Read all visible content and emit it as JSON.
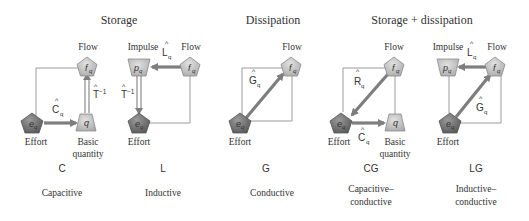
{
  "groups": {
    "storage": "Storage",
    "dissipation": "Dissipation",
    "storage_dissipation": "Storage + dissipation"
  },
  "node_labels": {
    "flow": "Flow",
    "impulse": "Impulse",
    "effort": "Effort",
    "basic_quantity_1": "Basic",
    "basic_quantity_2": "quantity"
  },
  "symbols": {
    "f": "f",
    "p": "p",
    "e": "e",
    "q": "q",
    "sub": "q",
    "hat": "^"
  },
  "operators": {
    "C": "C",
    "L": "L",
    "G": "G",
    "R": "R",
    "T": "T",
    "Tinv_sup": "−1"
  },
  "panels": [
    {
      "code": "C",
      "name_1": "Capacitive",
      "name_2": ""
    },
    {
      "code": "L",
      "name_1": "Inductive",
      "name_2": ""
    },
    {
      "code": "G",
      "name_1": "Conductive",
      "name_2": ""
    },
    {
      "code": "CG",
      "name_1": "Capacitive–",
      "name_2": "conductive"
    },
    {
      "code": "LG",
      "name_1": "Inductive–",
      "name_2": "conductive"
    }
  ],
  "colors": {
    "shape_dark": "#6e6e6e",
    "shape_light": "#c4c4c4",
    "arrow": "#7e7e7e",
    "frame": "#9a9a9a",
    "text": "#333333"
  }
}
